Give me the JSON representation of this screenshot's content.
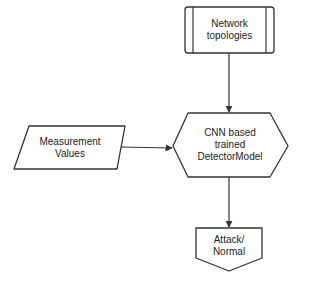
{
  "nodes": {
    "network_topologies": {
      "line1": "Network",
      "line2": "topologies",
      "shape": "predefined-process"
    },
    "measurement_values": {
      "line1": "Measurement",
      "line2": "Values",
      "shape": "parallelogram"
    },
    "detector_model": {
      "line1": "CNN based",
      "line2": "trained",
      "line3": "DetectorModel",
      "shape": "hexagon"
    },
    "output": {
      "line1": "Attack/",
      "line2": "Normal",
      "shape": "offpage-connector"
    }
  },
  "edges": [
    {
      "from": "network_topologies",
      "to": "detector_model"
    },
    {
      "from": "measurement_values",
      "to": "detector_model"
    },
    {
      "from": "detector_model",
      "to": "output"
    }
  ],
  "colors": {
    "stroke": "#333333",
    "fill": "#ffffff",
    "text": "#222222"
  }
}
